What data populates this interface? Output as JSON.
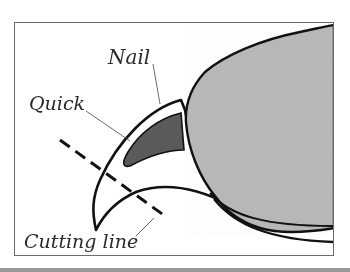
{
  "diagram": {
    "type": "labeled illustration",
    "labels": {
      "nail": "Nail",
      "quick": "Quick",
      "cutting_line": "Cutting line"
    },
    "colors": {
      "fur": "#b8b8b8",
      "quick": "#5a5a5a",
      "outline": "#111111",
      "frame": "#6a6a6a",
      "label_text": "#2a2a2a"
    }
  }
}
